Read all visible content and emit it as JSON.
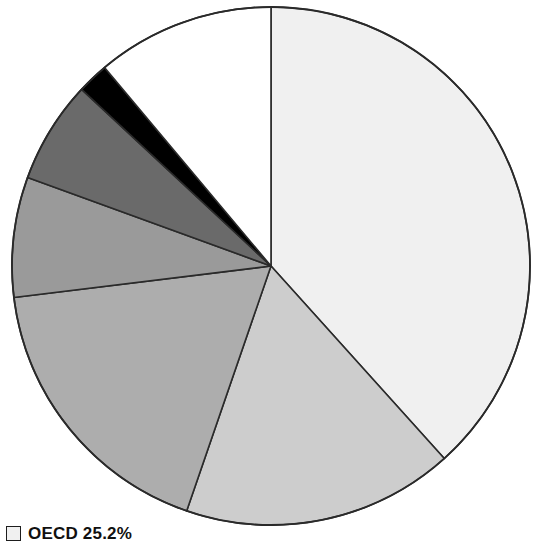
{
  "figure": {
    "background_color": "#ffffff",
    "outline_color": "#2a2a2a"
  },
  "chart_data": {
    "type": "pie",
    "title": "",
    "subtitle": "",
    "xlabel": "",
    "ylabel": "",
    "grid": false,
    "legend_position": "bottom-left",
    "start_angle_deg": 0,
    "direction": "clockwise",
    "center_px": [
      271,
      266
    ],
    "radius_px": 259,
    "labels": [
      "OECD",
      "Slice 2",
      "Slice 3",
      "Slice 4",
      "Slice 5",
      "Slice 6",
      "Slice 7"
    ],
    "values": [
      38.3,
      17.0,
      17.8,
      7.5,
      6.4,
      2.0,
      11.0
    ],
    "percent_labels": [
      "38.3%",
      "17.0%",
      "17.8%",
      "7.5%",
      "6.4%",
      "2.0%",
      "11.0%"
    ],
    "colors": [
      "#f0f0f0",
      "#cdcdcd",
      "#adadad",
      "#9a9a9a",
      "#6a6a6a",
      "#000000",
      "#ffffff"
    ],
    "slice_boundaries_deg": [
      0,
      138,
      199,
      263,
      290,
      313,
      320,
      360
    ]
  },
  "legend": {
    "entries": [
      {
        "marker_color": "#f0f0f0",
        "label": "OECD 25.2%"
      }
    ]
  }
}
